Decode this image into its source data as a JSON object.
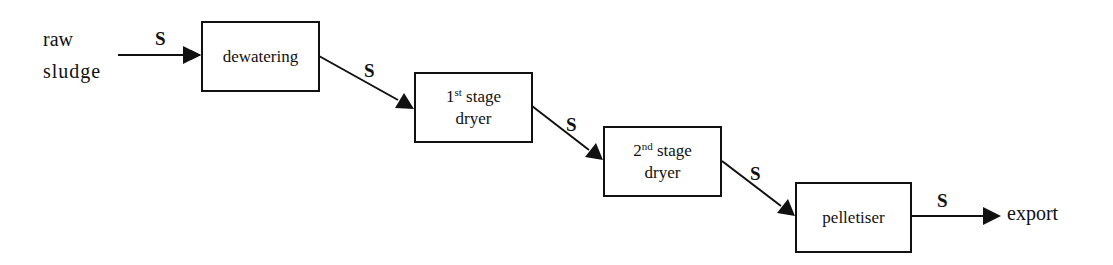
{
  "diagram": {
    "type": "process-flow",
    "input": {
      "line1": "raw",
      "line2": "sludge"
    },
    "output": "export",
    "stream_label": "S",
    "nodes": [
      {
        "id": "dewatering",
        "label": "dewatering"
      },
      {
        "id": "dryer1",
        "num": "1",
        "sup": "st",
        "line1_rest": " stage",
        "line2": "dryer"
      },
      {
        "id": "dryer2",
        "num": "2",
        "sup": "nd",
        "line1_rest": " stage",
        "line2": "dryer"
      },
      {
        "id": "pelletiser",
        "label": "pelletiser"
      }
    ],
    "edges": [
      {
        "from": "raw sludge",
        "to": "dewatering",
        "label": "S"
      },
      {
        "from": "dewatering",
        "to": "dryer1",
        "label": "S"
      },
      {
        "from": "dryer1",
        "to": "dryer2",
        "label": "S"
      },
      {
        "from": "dryer2",
        "to": "pelletiser",
        "label": "S"
      },
      {
        "from": "pelletiser",
        "to": "export",
        "label": "S"
      }
    ]
  }
}
